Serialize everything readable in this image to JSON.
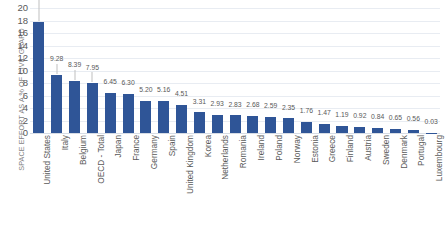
{
  "chart_data": {
    "type": "bar",
    "title": "",
    "xlabel": "",
    "ylabel": "SPACE EFFORT AS A % OF CIVIL GBARD",
    "ylim": [
      0,
      20
    ],
    "ytick_labels": [
      "20",
      "18",
      "16",
      "14",
      "12",
      "10",
      "8",
      "6",
      "4",
      "2",
      "0"
    ],
    "yticks": [
      20,
      18,
      16,
      14,
      12,
      10,
      8,
      6,
      4,
      2,
      0
    ],
    "grid": true,
    "legend": "none",
    "bar_color": "#2f5597",
    "label_color": "#595959",
    "gridline_color": "#e8ecf2",
    "categories": [
      "United States",
      "Italy",
      "Belgium",
      "OECD - Total",
      "Japan",
      "France",
      "Germany",
      "Spain",
      "United Kingdom",
      "Korea",
      "Netherlands",
      "Romania",
      "Ireland",
      "Poland",
      "Norway",
      "Estonia",
      "Greece",
      "Finland",
      "Austria",
      "Sweden",
      "Denmark",
      "Portugal",
      "Luxembourg"
    ],
    "values": [
      17.72,
      9.28,
      8.39,
      7.95,
      6.45,
      6.3,
      5.2,
      5.16,
      4.51,
      3.31,
      2.93,
      2.83,
      2.68,
      2.59,
      2.35,
      1.76,
      1.47,
      1.19,
      0.92,
      0.84,
      0.65,
      0.56,
      0.03
    ],
    "value_labels": [
      "17.72",
      "9.28",
      "8.39",
      "7.95",
      "6.45",
      "6.30",
      "5.20",
      "5.16",
      "4.51",
      "3.31",
      "2.93",
      "2.83",
      "2.68",
      "2.59",
      "2.35",
      "1.76",
      "1.47",
      "1.19",
      "0.92",
      "0.84",
      "0.65",
      "0.56",
      "0.03"
    ]
  }
}
